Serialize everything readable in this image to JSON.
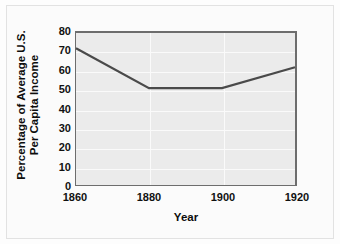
{
  "chart_data": {
    "type": "line",
    "title": "",
    "xlabel": "Year",
    "ylabel": "Percentage of Average U.S. Per Capita Income",
    "ylabel_lines": [
      "Percentage of Average U.S.",
      "Per Capita Income"
    ],
    "x": [
      1860,
      1880,
      1900,
      1920
    ],
    "xtick_labels": [
      "1860",
      "1880",
      "1900",
      "1920"
    ],
    "ytick_labels": [
      "0",
      "10",
      "20",
      "30",
      "40",
      "50",
      "60",
      "70",
      "80"
    ],
    "yticks": [
      0,
      10,
      20,
      30,
      40,
      50,
      60,
      70,
      80
    ],
    "values": [
      72,
      51,
      51,
      62
    ],
    "xlim": [
      1860,
      1920
    ],
    "ylim": [
      0,
      80
    ],
    "grid": true,
    "legend": null,
    "series": [
      {
        "name": "Percentage of Average U.S. Per Capita Income",
        "values": [
          72,
          51,
          51,
          62
        ],
        "color": "#4a4a4a"
      }
    ],
    "colors": {
      "line": "#4a4a4a",
      "plot_background": "#ebebeb",
      "grid": "#fafafa",
      "axis": "#6d6d6d",
      "text": "#111111",
      "figure_background": "#fbfbfb",
      "frame_border": "#e2e2e2"
    }
  }
}
